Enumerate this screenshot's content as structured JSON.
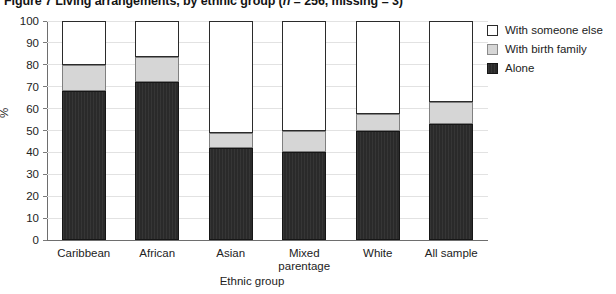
{
  "chart_data": {
    "type": "bar",
    "variant": "stacked",
    "title": "Figure 7  Living arrangements, by ethnic group (n = 256, missing = 3)",
    "title_prefix": "Figure 7  Living arrangements, by ethnic group (",
    "title_italic_n": "n",
    "title_suffix": " = 256, missing = 3)",
    "xlabel": "Ethnic group",
    "ylabel": "%",
    "ylim": [
      0,
      100
    ],
    "ytick_step": 10,
    "yticks": [
      100,
      90,
      80,
      70,
      60,
      50,
      40,
      30,
      20,
      10,
      0
    ],
    "grid": true,
    "legend_position": "top-right",
    "categories": [
      "Caribbean",
      "African",
      "Asian",
      "Mixed parentage",
      "White",
      "All sample"
    ],
    "category_lines": [
      [
        "Caribbean"
      ],
      [
        "African"
      ],
      [
        "Asian"
      ],
      [
        "Mixed",
        "parentage"
      ],
      [
        "White"
      ],
      [
        "All sample"
      ]
    ],
    "series": [
      {
        "name": "Alone",
        "color": "#2a2a2a",
        "values": [
          68,
          72,
          42,
          40,
          50,
          53
        ]
      },
      {
        "name": "With birth family",
        "color": "#d6d6d6",
        "values": [
          12,
          11.5,
          7,
          10,
          7.5,
          10
        ]
      },
      {
        "name": "With someone else",
        "color": "#ffffff",
        "values": [
          20,
          16.5,
          51,
          50,
          42.5,
          37
        ]
      }
    ],
    "stack_order_bottom_to_top": [
      "Alone",
      "With birth family",
      "With someone else"
    ],
    "cumulative_tops": {
      "Alone": [
        68,
        72,
        42,
        40,
        50,
        53
      ],
      "With birth family": [
        80,
        83.5,
        49,
        50,
        57.5,
        63
      ],
      "With someone else": [
        100,
        100,
        100,
        100,
        100,
        100
      ]
    }
  },
  "legend": {
    "items": [
      {
        "label": "With someone else",
        "swatch": "someone-else"
      },
      {
        "label": "With birth family",
        "swatch": "birth-family"
      },
      {
        "label": "Alone",
        "swatch": "alone"
      }
    ]
  }
}
